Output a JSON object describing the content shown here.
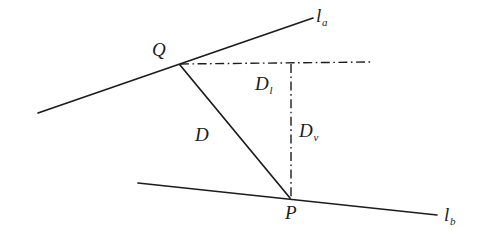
{
  "figure": {
    "type": "geometry-diagram",
    "background_color": "#ffffff",
    "stroke_color": "#1c1c1c",
    "width": 479,
    "height": 243
  },
  "labels": {
    "line_a": {
      "base": "l",
      "sub": "a"
    },
    "line_b": {
      "base": "l",
      "sub": "b"
    },
    "point_q": {
      "base": "Q",
      "sub": ""
    },
    "point_p": {
      "base": "P",
      "sub": ""
    },
    "distance_d": {
      "base": "D",
      "sub": ""
    },
    "distance_dl": {
      "base": "D",
      "sub": "l"
    },
    "distance_dv": {
      "base": "D",
      "sub": "v"
    }
  },
  "geometry": {
    "line_a": {
      "x1": 38,
      "y1": 113,
      "x2": 313,
      "y2": 18
    },
    "line_b": {
      "x1": 138,
      "y1": 183,
      "x2": 437,
      "y2": 215
    },
    "segment_d": {
      "x1": 180,
      "y1": 65,
      "x2": 290,
      "y2": 198
    },
    "dashdot_horizontal": {
      "x1": 180,
      "y1": 64,
      "x2": 371,
      "y2": 62
    },
    "dashdot_vertical": {
      "x1": 291,
      "y1": 64,
      "x2": 291,
      "y2": 198
    },
    "point_q": {
      "x": 180,
      "y": 65
    },
    "point_p": {
      "x": 290,
      "y": 198
    }
  },
  "label_positions": {
    "line_a": {
      "x": 316,
      "y": 6
    },
    "line_b": {
      "x": 444,
      "y": 205
    },
    "point_q": {
      "x": 152,
      "y": 40
    },
    "point_p": {
      "x": 285,
      "y": 203
    },
    "distance_d": {
      "x": 195,
      "y": 125
    },
    "distance_dl": {
      "x": 255,
      "y": 74
    },
    "distance_dv": {
      "x": 299,
      "y": 121
    }
  }
}
